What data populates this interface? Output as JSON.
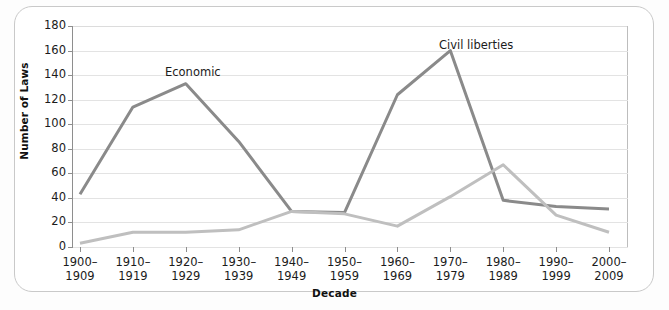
{
  "chart_data": {
    "type": "line",
    "title": "",
    "subtitle": "",
    "xlabel": "Decade",
    "ylabel": "Number of Laws",
    "categories": [
      "1900–\n1909",
      "1910–\n1919",
      "1920–\n1929",
      "1930–\n1939",
      "1940–\n1949",
      "1950–\n1959",
      "1960–\n1969",
      "1970–\n1979",
      "1980–\n1989",
      "1990–\n1999",
      "2000–\n2009"
    ],
    "category_labels": [
      {
        "top": "1900–",
        "bottom": "1909"
      },
      {
        "top": "1910–",
        "bottom": "1919"
      },
      {
        "top": "1920–",
        "bottom": "1929"
      },
      {
        "top": "1930–",
        "bottom": "1939"
      },
      {
        "top": "1940–",
        "bottom": "1949"
      },
      {
        "top": "1950–",
        "bottom": "1959"
      },
      {
        "top": "1960–",
        "bottom": "1969"
      },
      {
        "top": "1970–",
        "bottom": "1979"
      },
      {
        "top": "1980–",
        "bottom": "1989"
      },
      {
        "top": "1990–",
        "bottom": "1999"
      },
      {
        "top": "2000–",
        "bottom": "2009"
      }
    ],
    "ylim": [
      0,
      180
    ],
    "yticks": [
      0,
      20,
      40,
      60,
      80,
      100,
      120,
      140,
      160,
      180
    ],
    "grid": true,
    "legend_position": "inline-annotation",
    "series": [
      {
        "name": "Economic",
        "color": "#8a8a8a",
        "values": [
          43,
          114,
          133,
          86,
          29,
          28,
          124,
          160,
          38,
          33,
          31
        ],
        "label_x_pct": 25.0,
        "label_y_pct": 21.0
      },
      {
        "name": "Civil liberties",
        "color": "#bfbfbf",
        "values": [
          3,
          12,
          12,
          14,
          29,
          27,
          17,
          41,
          67,
          26,
          12
        ],
        "label_x_pct": 63.0,
        "label_y_pct": 7.0
      }
    ],
    "annotations": [
      {
        "text": "Economic",
        "x_px": 165,
        "y_px": 65
      },
      {
        "text": "Civil liberties",
        "x_px": 439,
        "y_px": 38
      }
    ]
  },
  "colors": {
    "economic": "#8a8a8a",
    "civil_liberties": "#bfbfbf",
    "grid": "#e3e3e3",
    "axis": "#8e8e8e",
    "text": "#1b1b1b",
    "card_border": "#c9c9c9",
    "background": "#ffffff"
  }
}
